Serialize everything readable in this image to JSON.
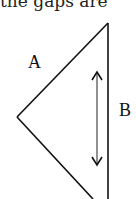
{
  "caption_fragment": "the gaps are",
  "diagram": {
    "labels": {
      "a": "A",
      "b": "B"
    },
    "stroke_color": "#111111",
    "shapes": [
      {
        "type": "line",
        "name": "side-a-upper",
        "from": [
          108,
          23
        ],
        "to": [
          17,
          117
        ]
      },
      {
        "type": "line",
        "name": "side-a-lower",
        "from": [
          17,
          117
        ],
        "to": [
          93,
          199
        ]
      },
      {
        "type": "line",
        "name": "side-b",
        "from": [
          108,
          23
        ],
        "to": [
          108,
          199
        ]
      },
      {
        "type": "double-arrow",
        "name": "length-indicator",
        "from": [
          97,
          72
        ],
        "to": [
          97,
          165
        ]
      }
    ]
  }
}
